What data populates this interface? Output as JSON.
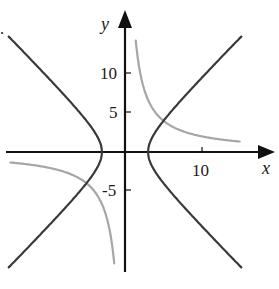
{
  "chart_data": {
    "type": "line",
    "title": "",
    "xlabel": "x",
    "ylabel": "y",
    "xlim": [
      -14.5,
      15.5
    ],
    "ylim": [
      -17,
      16
    ],
    "grid": false,
    "legend": null,
    "x_ticks": [
      {
        "value": 10,
        "label": "10"
      }
    ],
    "y_ticks": [
      {
        "value": 10,
        "label": "10"
      },
      {
        "value": 5,
        "label": "5"
      },
      {
        "value": -5,
        "label": "-5"
      }
    ],
    "series": [
      {
        "name": "hyperbola x^2 - y^2 = 9",
        "equation": "x^2 - y^2 = 9",
        "color": "#3a3a3a",
        "branches": [
          "right",
          "left"
        ],
        "y_range": [
          -14.8,
          14.8
        ]
      },
      {
        "name": "hyperbola xy = 20",
        "equation": "xy = 20",
        "color": "#a6a6a6",
        "branches": [
          {
            "x_range": [
              1.4,
              14.9
            ]
          },
          {
            "x_range": [
              -14.9,
              -1.4
            ]
          }
        ]
      }
    ],
    "intersections": [
      [
        5,
        4
      ],
      [
        -5,
        -4
      ]
    ]
  },
  "labels": {
    "x_axis": "x",
    "y_axis": "y",
    "x_tick_10": "10",
    "y_tick_10": "10",
    "y_tick_5": "5",
    "y_tick_neg5": "-5",
    "corner_mark": "."
  }
}
